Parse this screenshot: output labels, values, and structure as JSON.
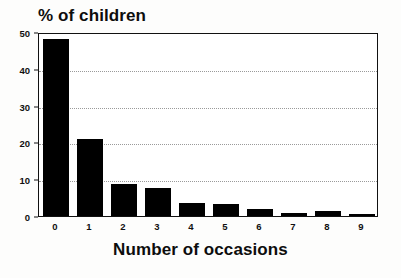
{
  "chart_data": {
    "type": "bar",
    "title": "% of children",
    "xlabel": "Number of occasions",
    "ylabel": "",
    "categories": [
      "0",
      "1",
      "2",
      "3",
      "4",
      "5",
      "6",
      "7",
      "8",
      "9"
    ],
    "values": [
      48,
      21,
      8.6,
      7.7,
      3.6,
      3.2,
      2.0,
      0.8,
      1.3,
      0.5
    ],
    "ylim": [
      0,
      50
    ],
    "yticks": [
      0,
      10,
      20,
      30,
      40,
      50
    ],
    "ytick_labels": [
      "0",
      "10",
      "20",
      "30",
      "40",
      "50"
    ],
    "xlim_categories": true,
    "grid": "horizontal-dotted",
    "legend": "none",
    "bar_color": "#000000",
    "background_color": "#ffffff",
    "axis_color": "#111111",
    "gridline_color": "#9a9a9a"
  }
}
